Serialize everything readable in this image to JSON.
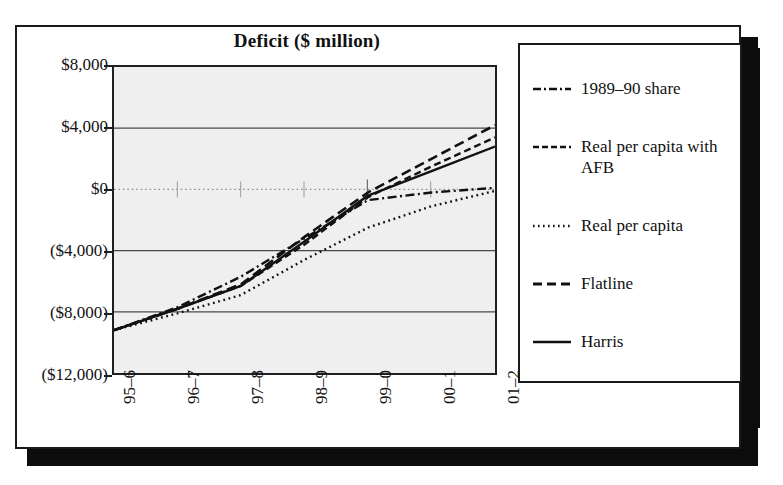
{
  "top_caption": "",
  "chart": {
    "title": "Deficit ($ million)",
    "y_ticks": [
      "$8,000",
      "$4,000",
      "$0",
      "($4,000)",
      "($8,000)",
      "($12,000)"
    ],
    "x_ticks": [
      "95–6",
      "96–7",
      "97–8",
      "98–9",
      "99–0",
      "00–1",
      "01–2"
    ]
  },
  "legend": {
    "items": [
      {
        "label": "1989–90 share",
        "style": "dash-dot"
      },
      {
        "label": "Real per capita with AFB",
        "style": "dashed-medium"
      },
      {
        "label": "Real per capita",
        "style": "dotted"
      },
      {
        "label": "Flatline",
        "style": "dashed-long"
      },
      {
        "label": "Harris",
        "style": "solid"
      }
    ]
  },
  "colors": {
    "ink": "#111111",
    "plot_background": "#efefef",
    "gridline": "#555555",
    "frame": "#1a1a1a",
    "shadow": "#0c0c0c"
  },
  "chart_data": {
    "type": "line",
    "title": "Deficit ($ million)",
    "xlabel": "",
    "ylabel": "",
    "grid": true,
    "legend_position": "right",
    "x": [
      "95–6",
      "96–7",
      "97–8",
      "98–9",
      "99–0",
      "00–1",
      "01–2"
    ],
    "xtick_labels": [
      "95–6",
      "96–7",
      "97–8",
      "98–9",
      "99–0",
      "00–1",
      "01–2"
    ],
    "ytick_labels": [
      "$8,000",
      "$4,000",
      "$0",
      "($4,000)",
      "($8,000)",
      "($12,000)"
    ],
    "ytick_values": [
      8000,
      4000,
      0,
      -4000,
      -8000,
      -12000
    ],
    "ylim": [
      -12000,
      8000
    ],
    "series": [
      {
        "name": "1989–90 share",
        "style": "dash-dot",
        "values": [
          -9200,
          -7700,
          -5700,
          -3200,
          -700,
          -200,
          100
        ]
      },
      {
        "name": "Real per capita with AFB",
        "style": "dashed-medium",
        "values": [
          -9200,
          -7800,
          -6300,
          -3600,
          -500,
          1500,
          3400
        ]
      },
      {
        "name": "Real per capita",
        "style": "dotted",
        "values": [
          -9200,
          -8100,
          -6900,
          -4600,
          -2500,
          -1100,
          -100
        ]
      },
      {
        "name": "Flatline",
        "style": "dashed-long",
        "values": [
          -9200,
          -7800,
          -6200,
          -3100,
          -200,
          2000,
          4200
        ]
      },
      {
        "name": "Harris",
        "style": "solid",
        "values": [
          -9200,
          -7800,
          -6300,
          -3400,
          -400,
          1200,
          2800
        ]
      }
    ]
  }
}
